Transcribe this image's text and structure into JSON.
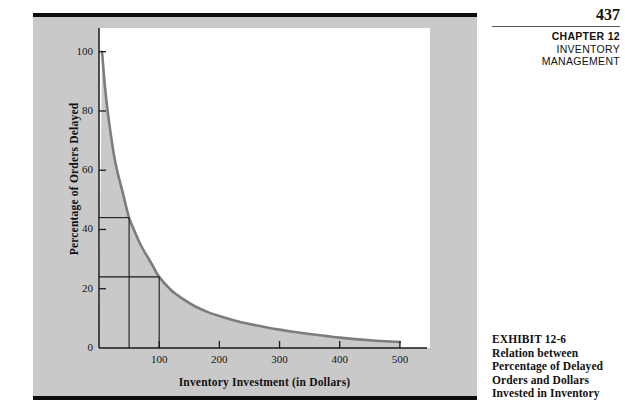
{
  "page": {
    "number": "437",
    "header_lines": [
      {
        "text": "CHAPTER 12",
        "bold": true
      },
      {
        "text": "INVENTORY",
        "bold": false
      },
      {
        "text": "MANAGEMENT",
        "bold": false
      }
    ]
  },
  "caption": {
    "lines": [
      "EXHIBIT 12-6",
      "Relation between",
      "Percentage of Delayed",
      "Orders and Dollars",
      "Invested in Inventory"
    ]
  },
  "colors": {
    "panel_background": "#c9c9c9",
    "plot_background": "#ffffff",
    "curve": "#7d7d7d",
    "axis": "#1a1a1a",
    "annotation_line": "#1a1a1a",
    "rule": "#0d0d0d",
    "text": "#111111"
  },
  "chart_data": {
    "type": "line",
    "title": "",
    "xlabel": "Inventory Investment (in Dollars)",
    "ylabel": "Percentage of Orders Delayed",
    "xlim": [
      0,
      550
    ],
    "ylim": [
      0,
      108
    ],
    "xticks": [
      100,
      200,
      300,
      400,
      500
    ],
    "xtick_labels": [
      "100",
      "200",
      "300",
      "400",
      "500"
    ],
    "yticks": [
      0,
      20,
      40,
      60,
      80,
      100
    ],
    "ytick_labels": [
      "0",
      "20",
      "40",
      "60",
      "80",
      "100"
    ],
    "grid": false,
    "legend": null,
    "series": [
      {
        "name": "Percentage of orders delayed",
        "x": [
          5,
          10,
          15,
          20,
          25,
          30,
          40,
          50,
          60,
          70,
          80,
          90,
          100,
          120,
          140,
          160,
          180,
          200,
          225,
          250,
          275,
          300,
          325,
          350,
          375,
          400,
          425,
          450,
          475,
          500
        ],
        "y": [
          100,
          88,
          79,
          71.5,
          65,
          60,
          52,
          44,
          39,
          34.5,
          31,
          27.5,
          24,
          19.5,
          16.5,
          14,
          12.2,
          10.8,
          9.3,
          8.1,
          7.1,
          6.2,
          5.4,
          4.7,
          4.1,
          3.5,
          3.0,
          2.6,
          2.3,
          2.0
        ]
      }
    ],
    "annotations": [
      {
        "type": "hline",
        "label": "44% delayed at $50 investment",
        "y": 44,
        "x_from": 0,
        "x_to": 50
      },
      {
        "type": "vline",
        "label": "$50 investment",
        "x": 50,
        "y_from": 0,
        "y_to": 44
      },
      {
        "type": "hline",
        "label": "24% delayed at $100 investment",
        "y": 24,
        "x_from": 0,
        "x_to": 100
      },
      {
        "type": "vline",
        "label": "$100 investment",
        "x": 100,
        "y_from": 0,
        "y_to": 24
      }
    ]
  }
}
